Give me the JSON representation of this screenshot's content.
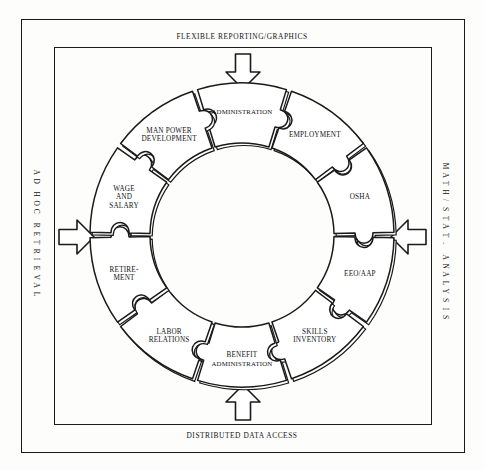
{
  "diagram": {
    "edges": {
      "top": "FLEXIBLE REPORTING/GRAPHICS",
      "bottom": "DISTRIBUTED DATA ACCESS",
      "left": "AD HOC RETRIEVAL",
      "right": "MATH/STAT. ANALYSIS"
    },
    "arrows": [
      {
        "name": "arrow-top",
        "direction": "down"
      },
      {
        "name": "arrow-right",
        "direction": "left"
      },
      {
        "name": "arrow-bottom",
        "direction": "up"
      },
      {
        "name": "arrow-left",
        "direction": "right"
      }
    ],
    "segments": [
      {
        "id": "administration",
        "lines": [
          "ADMINISTRATION"
        ],
        "angle": -90
      },
      {
        "id": "employment",
        "lines": [
          "EMPLOYMENT"
        ],
        "angle": -54
      },
      {
        "id": "osha",
        "lines": [
          "OSHA"
        ],
        "angle": -18
      },
      {
        "id": "eeo-aap",
        "lines": [
          "EEO/AAP"
        ],
        "angle": 18
      },
      {
        "id": "skills-inventory",
        "lines": [
          "SKILLS",
          "INVENTORY"
        ],
        "angle": 54
      },
      {
        "id": "benefit-administration",
        "lines": [
          "BENEFIT",
          "ADMINISTRATION"
        ],
        "angle": 90
      },
      {
        "id": "labor-relations",
        "lines": [
          "LABOR",
          "RELATIONS"
        ],
        "angle": 126
      },
      {
        "id": "retirement",
        "lines": [
          "RETIRE-",
          "MENT"
        ],
        "angle": 162
      },
      {
        "id": "wage-and-salary",
        "lines": [
          "WAGE",
          "AND",
          "SALARY"
        ],
        "angle": 198
      },
      {
        "id": "man-power-development",
        "lines": [
          "MAN POWER",
          "DEVELOPMENT"
        ],
        "angle": 234
      }
    ],
    "colors": {
      "ink": "#1a1a1a",
      "paper": "#fdfdfc",
      "fill": "#ffffff"
    }
  }
}
